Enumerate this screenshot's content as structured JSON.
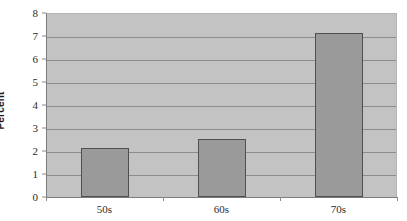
{
  "chart_data": {
    "type": "bar",
    "title": "",
    "subtitle": "",
    "xlabel": "",
    "ylabel": "Percent",
    "categories": [
      "50s",
      "60s",
      "70s"
    ],
    "values": [
      2.15,
      2.52,
      7.15
    ],
    "series": [
      {
        "name": "Percent",
        "values": [
          2.15,
          2.52,
          7.15
        ]
      }
    ],
    "ylim": [
      0,
      8
    ],
    "yticks": [
      0,
      1,
      2,
      3,
      4,
      5,
      6,
      7,
      8
    ],
    "ytick_labels": [
      "0",
      "1",
      "2",
      "3",
      "4",
      "5",
      "6",
      "7",
      "8"
    ],
    "grid": "horizontal",
    "legend": "none",
    "colors": {
      "bar_fill": "#9a9a9a",
      "bar_border": "#4f4f4f",
      "plot_background": "#c3c3c3",
      "gridline": "#8d8d8d",
      "axis_line": "#7d7d7d",
      "figure_background": "#ffffff",
      "text": "#2b2b2b"
    }
  }
}
